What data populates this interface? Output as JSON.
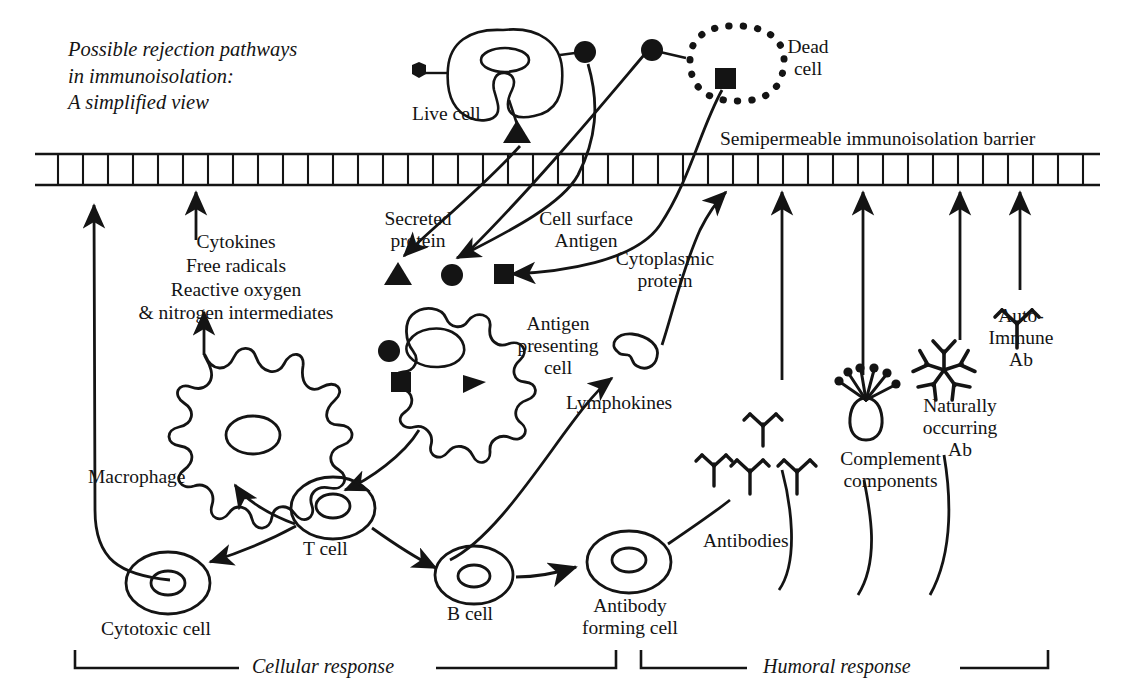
{
  "figure": {
    "title_lines": [
      "Possible rejection pathways",
      "in immunoisolation:",
      "A simplified view"
    ],
    "ink_color": "#141414",
    "background": "#ffffff"
  },
  "barrier": {
    "label": "Semipermeable immunoisolation barrier",
    "style": "ladder-band"
  },
  "cells": {
    "live_cell": "Live cell",
    "dead_cell_line1": "Dead",
    "dead_cell_line2": "cell",
    "macrophage": "Macrophage",
    "antigen_presenting_cell_line1": "Antigen",
    "antigen_presenting_cell_line2": "presenting",
    "antigen_presenting_cell_line3": "cell",
    "t_cell": "T cell",
    "b_cell": "B cell",
    "cytotoxic_cell": "Cytotoxic cell",
    "antibody_forming_cell_line1": "Antibody",
    "antibody_forming_cell_line2": "forming cell"
  },
  "molecules": {
    "secreted_protein_line1": "Secreted",
    "secreted_protein_line2": "protein",
    "cell_surface_line1": "Cell surface",
    "cell_surface_line2": "Antigen",
    "cytoplasmic_line1": "Cytoplasmic",
    "cytoplasmic_line2": "protein",
    "lymphokines": "Lymphokines",
    "antibodies": "Antibodies",
    "complement_line1": "Complement",
    "complement_line2": "components",
    "naturally_line1": "Naturally",
    "naturally_line2": "occurring",
    "naturally_line3": "Ab",
    "autoimmune_line1": "Auto-",
    "autoimmune_line2": "Immune",
    "autoimmune_line3": "Ab"
  },
  "mediators": {
    "line1": "Cytokines",
    "line2": "Free radicals",
    "line3": "Reactive oxygen",
    "line4": "& nitrogen intermediates"
  },
  "responses": {
    "cellular": "Cellular response",
    "humoral": "Humoral response"
  }
}
